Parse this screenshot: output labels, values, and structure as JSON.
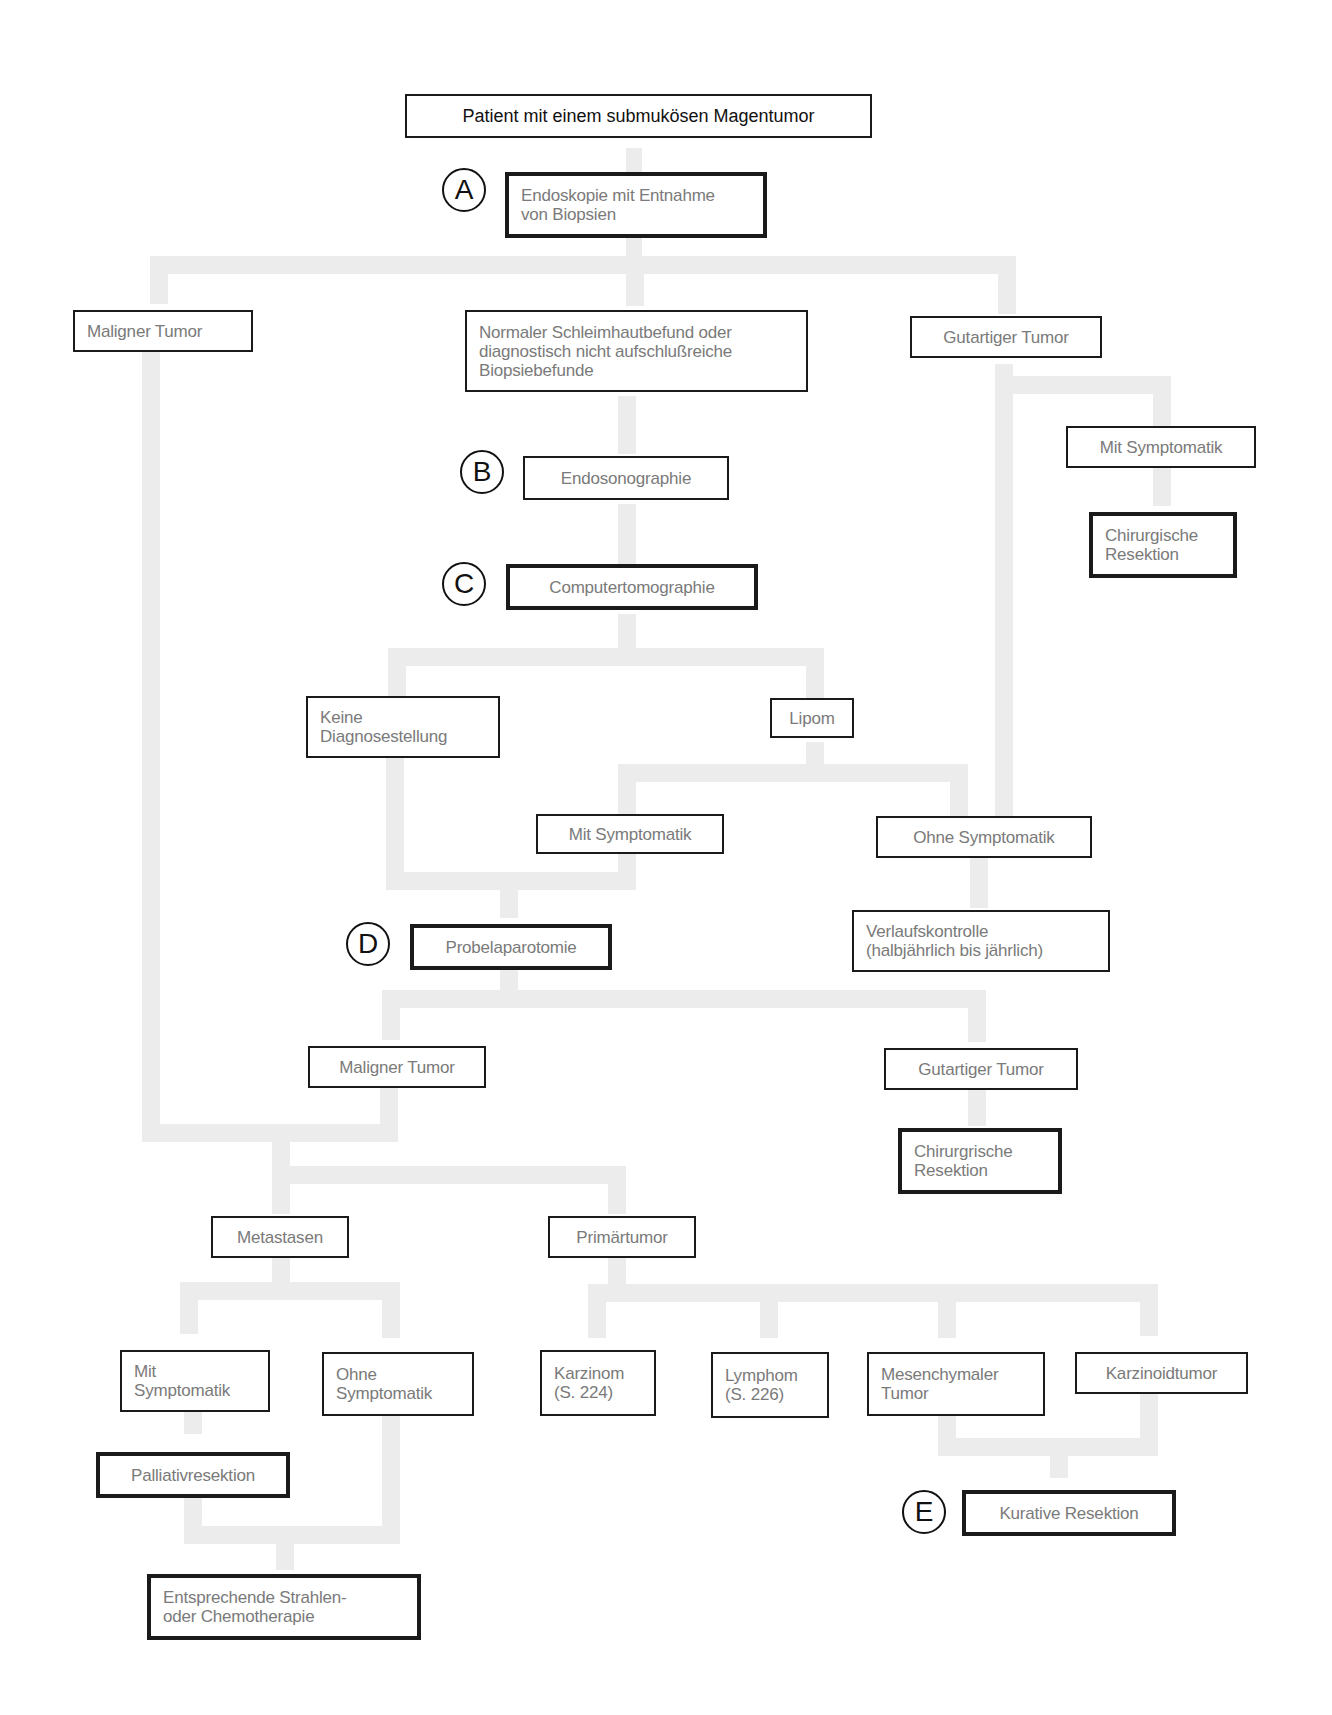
{
  "diagram": {
    "title": "Patient mit einem  submukösen Magentumor",
    "markers": {
      "a": "A",
      "b": "B",
      "c": "C",
      "d": "D",
      "e": "E"
    },
    "nodes": {
      "endoskopie": "Endoskopie mit Entnahme\nvon Biopsien",
      "maligner_tumor_1": "Maligner Tumor",
      "normaler_befund": "Normaler Schleimhautbefund oder\ndiagnostisch nicht aufschlußreiche\nBiopsiebefunde",
      "gutartiger_tumor_1": "Gutartiger Tumor",
      "mit_symptomatik_1": "Mit Symptomatik",
      "chirurgische_resektion_1": "Chirurgische\nResektion",
      "endosonographie": "Endosonographie",
      "computertomographie": "Computertomographie",
      "keine_diagnose": "Keine\nDiagnosestellung",
      "lipom": "Lipom",
      "mit_symptomatik_2": "Mit Symptomatik",
      "ohne_symptomatik_1": "Ohne Symptomatik",
      "probelaparotomie": "Probelaparotomie",
      "verlaufskontrolle": "Verlaufskontrolle\n(halbjährlich bis jährlich)",
      "maligner_tumor_2": "Maligner Tumor",
      "gutartiger_tumor_2": "Gutartiger Tumor",
      "chirurgische_resektion_2": "Chirurgrische\nResektion",
      "metastasen": "Metastasen",
      "primaertumor": "Primärtumor",
      "mit_symptomatik_3": "Mit\nSymptomatik",
      "ohne_symptomatik_2": "Ohne\nSymptomatik",
      "karzinom": "Karzinom\n(S. 224)",
      "lymphom": "Lymphom\n(S. 226)",
      "mesenchymaler_tumor": "Mesenchymaler\nTumor",
      "karzinoidtumor": "Karzinoidtumor",
      "palliativresektion": "Palliativresektion",
      "kurative_resektion": "Kurative Resektion",
      "strahlen_chemo": "Entsprechende Strahlen-\noder Chemotherapie"
    },
    "colors": {
      "connector": "#ececec",
      "border": "#1a1a1a",
      "text": "#7a7a7a",
      "title_text": "#111111"
    }
  }
}
